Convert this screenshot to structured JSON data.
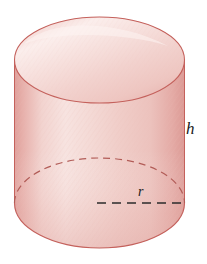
{
  "figure": {
    "kind": "geometry-diagram",
    "shape_name": "cylinder",
    "background_color": "#ffffff",
    "labels": {
      "height_label": "h",
      "radius_label": "r"
    },
    "colors": {
      "fill_light": "#f7e2df",
      "fill_mid": "#f0cdc9",
      "fill_edge": "#e2a7a3",
      "outline": "#c4615c",
      "outline_soft": "#cd7a74",
      "dash_dark": "#2b2b2b",
      "label_color": "#1b1b1b",
      "highlight": "#fbeeeb"
    },
    "geometry": {
      "center_x": 99.5,
      "radius_x": 85,
      "top_center_y": 60,
      "top_radius_y": 43,
      "bottom_center_y": 203,
      "bottom_radius_y": 45,
      "body_top_y": 60,
      "body_bottom_y": 203,
      "left_edge_x": 14.5,
      "right_edge_x": 184.5,
      "figure_top_y": 17,
      "figure_bottom_y": 249
    },
    "annotations": {
      "radius_line": {
        "name": "radius-dimension-line",
        "style": "dashed",
        "from_x": 97,
        "from_y": 203,
        "to_x": 185,
        "to_y": 203
      },
      "hidden_back_arc": {
        "name": "hidden-base-arc",
        "style": "dashed"
      },
      "height_marker": {
        "name": "height-label-marker",
        "position": "right-of-cylinder"
      }
    }
  }
}
